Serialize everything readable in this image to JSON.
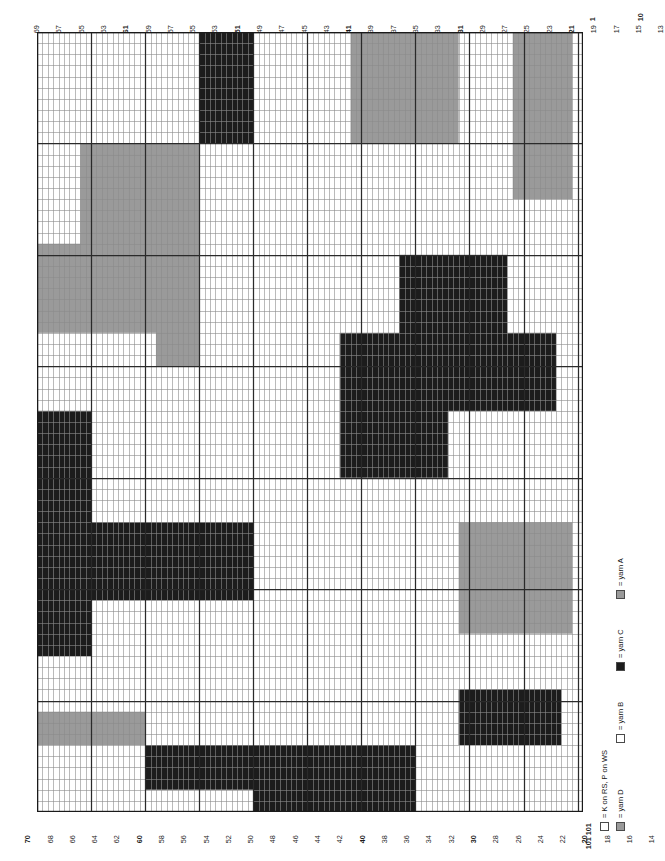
{
  "chart": {
    "type": "knitting-chart",
    "orientation": "landscape-rotated",
    "stitches": 101,
    "rows": 70,
    "cell_width_px": 5.406,
    "cell_height_px": 11.143,
    "heavy_line_every": 10,
    "colors": {
      "yarn_A": "#9a9a9a",
      "yarn_B": "#ffffff",
      "yarn_C": "#1c1c1c",
      "yarn_D": "#9a9a9a",
      "grid_line": "#8c8c8c",
      "heavy_line": "#2a2a2a",
      "border": "#1a1a1a"
    }
  },
  "top_axis": {
    "description": "odd stitch numbers running 69 down to 1, right-to-left",
    "labels": [
      69,
      67,
      65,
      63,
      61,
      59,
      57,
      55,
      53,
      51,
      49,
      47,
      45,
      43,
      41,
      39,
      37,
      35,
      33,
      31,
      29,
      27,
      25,
      23,
      21,
      19,
      17,
      15,
      13,
      11,
      9,
      7,
      5,
      3,
      1
    ],
    "bold_labels": [
      61,
      51,
      41,
      31,
      21,
      11,
      1
    ]
  },
  "bottom_axis": {
    "description": "even stitch numbers running 70 down to 2, left-to-right",
    "labels": [
      70,
      68,
      66,
      64,
      62,
      60,
      58,
      56,
      54,
      52,
      50,
      48,
      46,
      44,
      42,
      40,
      38,
      36,
      34,
      32,
      30,
      28,
      26,
      24,
      22,
      20,
      18,
      16,
      14,
      12,
      10,
      8,
      6,
      4,
      2
    ],
    "bold_labels": [
      70,
      60,
      40,
      30,
      20,
      10
    ],
    "row_marker": "101 101"
  },
  "right_axis": {
    "description": "row numbers down the right edge of the chart",
    "labels": [
      {
        "value": "1",
        "row": 1
      },
      {
        "value": "10",
        "row": 10
      },
      {
        "value": "20",
        "row": 20
      },
      {
        "value": "30",
        "row": 30
      },
      {
        "value": "40",
        "row": 40
      },
      {
        "value": "50",
        "row": 50
      },
      {
        "value": "60",
        "row": 60
      },
      {
        "value": "70",
        "row": 70
      },
      {
        "value": "80",
        "row": 80
      },
      {
        "value": "90",
        "row": 90
      },
      {
        "value": "101",
        "row": 101
      }
    ]
  },
  "legend": {
    "entries": [
      {
        "swatch": "white",
        "label": "= K on RS, P on WS",
        "key": "knit"
      },
      {
        "swatch": "grayD",
        "label": "= yarn D",
        "key": "yarn_D"
      },
      {
        "swatch": "white",
        "label": "= yarn B",
        "key": "yarn_B"
      },
      {
        "swatch": "black",
        "label": "= yarn C",
        "key": "yarn_C"
      },
      {
        "swatch": "grayA",
        "label": "= yarn A",
        "key": "yarn_A"
      }
    ]
  },
  "chart_data": {
    "type": "heatmap",
    "xlabel": "stitch",
    "ylabel": "row",
    "legend_position": "bottom-right",
    "grid": true,
    "palette": {
      "W": "#ffffff",
      "G": "#9a9a9a",
      "K": "#1c1c1c"
    },
    "cells": [
      "WWWWWWWWWWWWWWWWWWWWWWWWWWWWWWKKKKKKKKKKWWWWWWWWWWWWWWWWWWGGGGGGGGGGGGGGGGGGGGWWWWWWWWWWGGGGGGGGGGG",
      "WWWWWWWWWWWWWWWWWWWWWWWWWWWWWWKKKKKKKKKKWWWWWWWWWWWWWWWWWWGGGGGGGGGGGGGGGGGGGGWWWWWWWWWWGGGGGGGGGGG",
      "WWWWWWWWWWWWWWWWWWWWWWWWWWWWWWKKKKKKKKKKWWWWWWWWWWWWWWWWWWGGGGGGGGGGGGGGGGGGGGWWWWWWWWWWGGGGGGGGGGG",
      "WWWWWWWWWWWWWWWWWWWWWWWWWWWWWWKKKKKKKKKKWWWWWWWWWWWWWWWWWWGGGGGGGGGGGGGGGGGGGGWWWWWWWWWWGGGGGGGGGGG",
      "WWWWWWWWWWWWWWWWWWWWWWWWWWWWWWKKKKKKKKKKWWWWWWWWWWWWWWWWWWGGGGGGGGGGGGGGGGGGGGWWWWWWWWWWGGGGGGGGGGG",
      "WWWWWWWWWWWWWWWWWWWWWWWWWWWWWWKKKKKKKKKKWWWWWWWWWWWWWWWWWWGGGGGGGGGGGGGGGGGGGGWWWWWWWWWWGGGGGGGGGGG",
      "WWWWWWWWWWWWWWWWWWWWWWWWWWWWWWKKKKKKKKKKWWWWWWWWWWWWWWWWWWGGGGGGGGGGGGGGGGGGGGWWWWWWWWWWGGGGGGGGGGG",
      "WWWWWWWWWWWWWWWWWWWWWWWWWWWWWWKKKKKKKKKKWWWWWWWWWWWWWWWWWWGGGGGGGGGGGGGGGGGGGGWWWWWWWWWWGGGGGGGGGGG",
      "WWWWWWWWWWWWWWWWWWWWWWWWWWWWWWKKKKKKKKKKWWWWWWWWWWWWWWWWWWGGGGGGGGGGGGGGGGGGGGWWWWWWWWWWGGGGGGGGGGG",
      "WWWWWWWWWWWWWWWWWWWWWWWWWWWWWWKKKKKKKKKKWWWWWWWWWWWWWWWWWWGGGGGGGGGGGGGGGGGGGGWWWWWWWWWWGGGGGGGGGGG",
      "WWWWWWWWGGGGGGGGGGGGGGGGGGGGGGWWWWWWWWWWWWWWWWWWWWWWWWWWWWWWWWWWWWWWWWWWWWWWWWWWWWWWWWWWGGGGGGGGGGG",
      "WWWWWWWWGGGGGGGGGGGGGGGGGGGGGGWWWWWWWWWWWWWWWWWWWWWWWWWWWWWWWWWWWWWWWWWWWWWWWWWWWWWWWWWWGGGGGGGGGGG",
      "WWWWWWWWGGGGGGGGGGGGGGGGGGGGGGWWWWWWWWWWWWWWWWWWWWWWWWWWWWWWWWWWWWWWWWWWWWWWWWWWWWWWWWWWGGGGGGGGGGG",
      "WWWWWWWWGGGGGGGGGGGGGGGGGGGGGGWWWWWWWWWWWWWWWWWWWWWWWWWWWWWWWWWWWWWWWWWWWWWWWWWWWWWWWWWWGGGGGGGGGGG",
      "WWWWWWWWGGGGGGGGGGGGGGGGGGGGGGWWWWWWWWWWWWWWWWWWWWWWWWWWWWWWWWWWWWWWWWWWWWWWWWWWWWWWWWWWGGGGGGGGGGG",
      "WWWWWWWWGGGGGGGGGGGGGGGGGGGGGGWWWWWWWWWWWWWWWWWWWWWWWWWWWWWWWWWWWWWWWWWWWWWWWWWWWWWWWWWWWWWWWWWWWWW",
      "WWWWWWWWGGGGGGGGGGGGGGGGGGGGGGWWWWWWWWWWWWWWWWWWWWWWWWWWWWWWWWWWWWWWWWWWWWWWWWWWWWWWWWWWWWWWWWWWWWW",
      "WWWWWWWWGGGGGGGGGGGGGGGGGGGGGGWWWWWWWWWWWWWWWWWWWWWWWWWWWWWWWWWWWWWWWWWWWWWWWWWWWWWWWWWWWWWWWWWWWWW",
      "WWWWWWWWGGGGGGGGGGGGGGGGGGGGGGWWWWWWWWWWWWWWWWWWWWWWWWWWWWWWWWWWWWWWWWWWWWWWWWWWWWWWWWWWWWWWWWWWWWW",
      "GGGGGGGGGGGGGGGGGGGGGGGGGGGGGGWWWWWWWWWWWWWWWWWWWWWWWWWWWWWWWWWWWWWWWWWWWWWWWWWWWWWWWWWWWWWWWWWWWWW",
      "GGGGGGGGGGGGGGGGGGGGGGGGGGGGGGWWWWWWWWWWWWWWWWWWWWWWWWWWWWWWWWWWWWWKKKKKKKKKKKKKKKKKKKKWWWWWWWWWWWW",
      "GGGGGGGGGGGGGGGGGGGGGGGGGGGGGGWWWWWWWWWWWWWWWWWWWWWWWWWWWWWWWWWWWWWKKKKKKKKKKKKKKKKKKKKWWWWWWWWWWWW",
      "GGGGGGGGGGGGGGGGGGGGGGGGGGGGGGWWWWWWWWWWWWWWWWWWWWWWWWWWWWWWWWWWWWWKKKKKKKKKKKKKKKKKKKKWWWWWWWWWWWW",
      "GGGGGGGGGGGGGGGGGGGGGGGGGGGGGGWWWWWWWWWWWWWWWWWWWWWWWWWWWWWWWWWWWWWKKKKKKKKKKKKKKKKKKKKWWWWWWWWWWWW",
      "GGGGGGGGGGGGGGGGGGGGGGGGGGGGGGWWWWWWWWWWWWWWWWWWWWWWWWWWWWWWWWWWWWWKKKKKKKKKKKKKKKKKKKKWWWWWWWWWWWW",
      "GGGGGGGGGGGGGGGGGGGGGGGGGGGGGGWWWWWWWWWWWWWWWWWWWWWWWWWWWWWWWWWWWWWKKKKKKKKKKKKKKKKKKKKWWWWWWWWWWWW",
      "GGGGGGGGGGGGGGGGGGGGGGGGGGGGGGWWWWWWWWWWWWWWWWWWWWWWWWWWWWWWWWWWWWWKKKKKKKKKKKKKKKKKKKKWWWWWWWWWWWW",
      "WWWWWWWWWWWWWWWWWWWWWWGGGGGGGGWWWWWWWWWWWWWWWWWWWWWWWWWWKKKKKKKKKKKKKKKKKKKKKKKKKKKKKKKKKKKKKKKKWWW",
      "WWWWWWWWWWWWWWWWWWWWWWGGGGGGGGWWWWWWWWWWWWWWWWWWWWWWWWWWKKKKKKKKKKKKKKKKKKKKKKKKKKKKKKKKKKKKKKKKWWW",
      "WWWWWWWWWWWWWWWWWWWWWWGGGGGGGGWWWWWWWWWWWWWWWWWWWWWWWWWWKKKKKKKKKKKKKKKKKKKKKKKKKKKKKKKKKKKKKKKKWWW",
      "WWWWWWWWWWWWWWWWWWWWWWWWWWWWWWWWWWWWWWWWWWWWWWWWWWWWWWWWKKKKKKKKKKKKKKKKKKKKKKKKKKKKKKKKKKKKKKKKWWW",
      "WWWWWWWWWWWWWWWWWWWWWWWWWWWWWWWWWWWWWWWWWWWWWWWWWWWWWWWWKKKKKKKKKKKKKKKKKKKKKKKKKKKKKKKKKKKKKKKKWWW",
      "WWWWWWWWWWWWWWWWWWWWWWWWWWWWWWWWWWWWWWWWWWWWWWWWWWWWWWWWKKKKKKKKKKKKKKKKKKKKKKKKKKKKKKKKKKKKKKKKWWW",
      "WWWWWWWWWWWWWWWWWWWWWWWWWWWWWWWWWWWWWWWWWWWWWWWWWWWWWWWWKKKKKKKKKKKKKKKKKKKKKKKKKKKKKKKKKKKKKKKKWWW",
      "KKKKKKKKKKWWWWWWWWWWWWWWWWWWWWWWWWWWWWWWWWWWWWWWWWWWWWWWKKKKKKKKKKKKKKKKKKKKWWWWWWWWWWWWWWWWWWWWWWW",
      "KKKKKKKKKKWWWWWWWWWWWWWWWWWWWWWWWWWWWWWWWWWWWWWWWWWWWWWWKKKKKKKKKKKKKKKKKKKKWWWWWWWWWWWWWWWWWWWWWWW",
      "KKKKKKKKKKWWWWWWWWWWWWWWWWWWWWWWWWWWWWWWWWWWWWWWWWWWWWWWKKKKKKKKKKKKKKKKKKKKWWWWWWWWWWWWWWWWWWWWWWW",
      "KKKKKKKKKKWWWWWWWWWWWWWWWWWWWWWWWWWWWWWWWWWWWWWWWWWWWWWWKKKKKKKKKKKKKKKKKKKKWWWWWWWWWWWWWWWWWWWWWWW",
      "KKKKKKKKKKWWWWWWWWWWWWWWWWWWWWWWWWWWWWWWWWWWWWWWWWWWWWWWKKKKKKKKKKKKKKKKKKKKWWWWWWWWWWWWWWWWWWWWWWW",
      "KKKKKKKKKKWWWWWWWWWWWWWWWWWWWWWWWWWWWWWWWWWWWWWWWWWWWWWWKKKKKKKKKKKKKKKKKKKKWWWWWWWWWWWWWWWWWWWWWWW",
      "KKKKKKKKKKWWWWWWWWWWWWWWWWWWWWWWWWWWWWWWWWWWWWWWWWWWWWWWWWWWWWWWWWWWWWWWWWWWWWWWWWWWWWWWWWWWWWWWWWW",
      "KKKKKKKKKKWWWWWWWWWWWWWWWWWWWWWWWWWWWWWWWWWWWWWWWWWWWWWWWWWWWWWWWWWWWWWWWWWWWWWWWWWWWWWWWWWWWWWWWWW",
      "KKKKKKKKKKWWWWWWWWWWWWWWWWWWWWWWWWWWWWWWWWWWWWWWWWWWWWWWWWWWWWWWWWWWWWWWWWWWWWWWWWWWWWWWWWWWWWWWWWW",
      "KKKKKKKKKKWWWWWWWWWWWWWWWWWWWWWWWWWWWWWWWWWWWWWWWWWWWWWWWWWWWWWWWWWWWWWWWWWWWWWWWWWWWWWWWWWWWWWWWWW",
      "KKKKKKKKKKKKKKKKKKKKKKKKKKKKKKKKKKKKKKKKWWWWWWWWWWWWWWWWWWWWWWWWWWWWWWWWWWWWWWGGGGGGGGGGGGGGGGGGGGG",
      "KKKKKKKKKKKKKKKKKKKKKKKKKKKKKKKKKKKKKKKKWWWWWWWWWWWWWWWWWWWWWWWWWWWWWWWWWWWWWWGGGGGGGGGGGGGGGGGGGGG",
      "KKKKKKKKKKKKKKKKKKKKKKKKKKKKKKKKKKKKKKKKWWWWWWWWWWWWWWWWWWWWWWWWWWWWWWWWWWWWWWGGGGGGGGGGGGGGGGGGGGG",
      "KKKKKKKKKKKKKKKKKKKKKKKKKKKKKKKKKKKKKKKKWWWWWWWWWWWWWWWWWWWWWWWWWWWWWWWWWWWWWWGGGGGGGGGGGGGGGGGGGGG",
      "KKKKKKKKKKKKKKKKKKKKKKKKKKKKKKKKKKKKKKKKWWWWWWWWWWWWWWWWWWWWWWWWWWWWWWWWWWWWWWGGGGGGGGGGGGGGGGGGGGG",
      "KKKKKKKKKKKKKKKKKKKKKKKKKKKKKKKKKKKKKKKKWWWWWWWWWWWWWWWWWWWWWWWWWWWWWWWWWWWWWWGGGGGGGGGGGGGGGGGGGGG",
      "KKKKKKKKKKKKKKKKKKKKKKKKKKKKKKKKKKKKKKKKWWWWWWWWWWWWWWWWWWWWWWWWWWWWWWWWWWWWWWGGGGGGGGGGGGGGGGGGGGG",
      "KKKKKKKKKKWWWWWWWWWWWWWWWWWWWWWWWWWWWWWWWWWWWWWWWWWWWWWWWWWWWWWWWWWWWWWWWWWWWWGGGGGGGGGGGGGGGGGGGGG",
      "KKKKKKKKKKWWWWWWWWWWWWWWWWWWWWWWWWWWWWWWWWWWWWWWWWWWWWWWWWWWWWWWWWWWWWWWWWWWWWGGGGGGGGGGGGGGGGGGGGG",
      "KKKKKKKKKKWWWWWWWWWWWWWWWWWWWWWWWWWWWWWWWWWWWWWWWWWWWWWWWWWWWWWWWWWWWWWWWWWWWWGGGGGGGGGGGGGGGGGGGGG",
      "KKKKKKKKKKWWWWWWWWWWWWWWWWWWWWWWWWWWWWWWWWWWWWWWWWWWWWWWWWWWWWWWWWWWWWWWWWWWWWWWWWWWWWWWWWWWWWWWWWW",
      "KKKKKKKKKKWWWWWWWWWWWWWWWWWWWWWWWWWWWWWWWWWWWWWWWWWWWWWWWWWWWWWWWWWWWWWWWWWWWWWWWWWWWWWWWWWWWWWWWWW",
      "WWWWWWWWWWWWWWWWWWWWWWWWWWWWWWWWWWWWWWWWWWWWWWWWWWWWWWWWWWWWWWWWWWWWWWWWWWWWWWWWWWWWWWWWWWWWWWWWWWW",
      "WWWWWWWWWWWWWWWWWWWWWWWWWWWWWWWWWWWWWWWWWWWWWWWWWWWWWWWWWWWWWWWWWWWWWWWWWWWWWWWWWWWWWWWWWWWWWWWWWWW",
      "WWWWWWWWWWWWWWWWWWWWWWWWWWWWWWWWWWWWWWWWWWWWWWWWWWWWWWWWWWWWWWWWWWWWWWWWWWWWWWWWWWWWWWWWWWWWWWWWWWW",
      "WWWWWWWWWWWWWWWWWWWWWWWWWWWWWWWWWWWWWWWWWWWWWWWWWWWWWWWWWWWWWWWWWWWWWWWWWWWWWWKKKKKKKKKKKKKKKKKKKWW",
      "WWWWWWWWWWWWWWWWWWWWWWWWWWWWWWWWWWWWWWWWWWWWWWWWWWWWWWWWWWWWWWWWWWWWWWWWWWWWWWKKKKKKKKKKKKKKKKKKKWW",
      "GGGGGGGGGGGGGGGGGGGGWWWWWWWWWWWWWWWWWWWWWWWWWWWWWWWWWWWWWWWWWWWWWWWWWWWWWWWWWWKKKKKKKKKKKKKKKKKKKWW",
      "GGGGGGGGGGGGGGGGGGGGWWWWWWWWWWWWWWWWWWWWWWWWWWWWWWWWWWWWWWWWWWWWWWWWWWWWWWWWWWKKKKKKKKKKKKKKKKKKKWW",
      "GGGGGGGGGGGGGGGGGGGGWWWWWWWWWWWWWWWWWWWWWWWWWWWWWWWWWWWWWWWWWWWWWWWWWWWWWWWWWWKKKKKKKKKKKKKKKKKKKWW",
      "WWWWWWWWWWWWWWWWWWWWKKKKKKKKKKKKKKKKKKKKKKKKKKKKKKKKKKKKKKKKKKKKKKKKKKWWWWWWWWWWWWWWWWWWWWWWWWWWWWW",
      "WWWWWWWWWWWWWWWWWWWWKKKKKKKKKKKKKKKKKKKKKKKKKKKKKKKKKKKKKKKKKKKKKKKKKKWWWWWWWWWWWWWWWWWWWWWWWWWWWWW",
      "WWWWWWWWWWWWWWWWWWWWKKKKKKKKKKKKKKKKKKKKKKKKKKKKKKKKKKKKKKKKKKKKKKKKKKWWWWWWWWWWWWWWWWWWWWWWWWWWWWW",
      "WWWWWWWWWWWWWWWWWWWWKKKKKKKKKKKKKKKKKKKKKKKKKKKKKKKKKKKKKKKKKKKKKKKKKKWWWWWWWWWWWWWWWWWWWWWWWWWWWWW",
      "WWWWWWWWWWWWWWWWWWWWWWWWWWWWWWWWWWWWWWWWKKKKKKKKKKKKKKKKKKKKKKKKKKKKKKWWWWWWWWWWWWWWWWWWWWWWWWWWWWW",
      "WWWWWWWWWWWWWWWWWWWWWWWWWWWWWWWWWWWWWWWWKKKKKKKKKKKKKKKKKKKKKKKKKKKKKKWWWWWWWWWWWWWWWWWWWWWWWWWWWWW",
      "WWWWWWWWWWWWWWWWWWWWWWWWWWWWWWWWWWWWWWWWKKKKKKKKKKKKKKKKKKKKKKKKKKKKKKWWWWWWWWWWWWWWWWWWWWWWWWWWWWW"
    ]
  }
}
